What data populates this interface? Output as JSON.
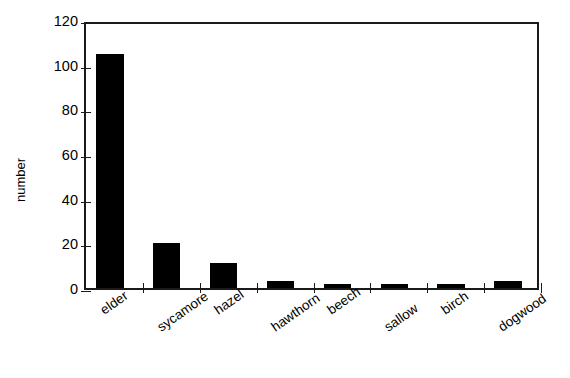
{
  "chart_data": {
    "type": "bar",
    "title": "",
    "subtitle": "",
    "xlabel": "",
    "ylabel": "number",
    "categories": [
      "elder",
      "sycamore",
      "hazel",
      "hawthorn",
      "beech",
      "sallow",
      "birch",
      "dogwood"
    ],
    "values": [
      105,
      20,
      11,
      3,
      2,
      2,
      2,
      3
    ],
    "ylim": [
      0,
      120
    ],
    "yticks": [
      0,
      20,
      40,
      60,
      80,
      100,
      120
    ],
    "ytick_labels": [
      "0",
      "20",
      "40",
      "60",
      "80",
      "100",
      "120"
    ],
    "grid": false,
    "legend": false,
    "legend_position": "none",
    "bar_color": "#000000",
    "axis_color": "#1a1a1a",
    "background_color": "#ffffff",
    "series": [
      {
        "name": "number",
        "values": [
          105,
          20,
          11,
          3,
          2,
          2,
          2,
          3
        ]
      }
    ]
  }
}
